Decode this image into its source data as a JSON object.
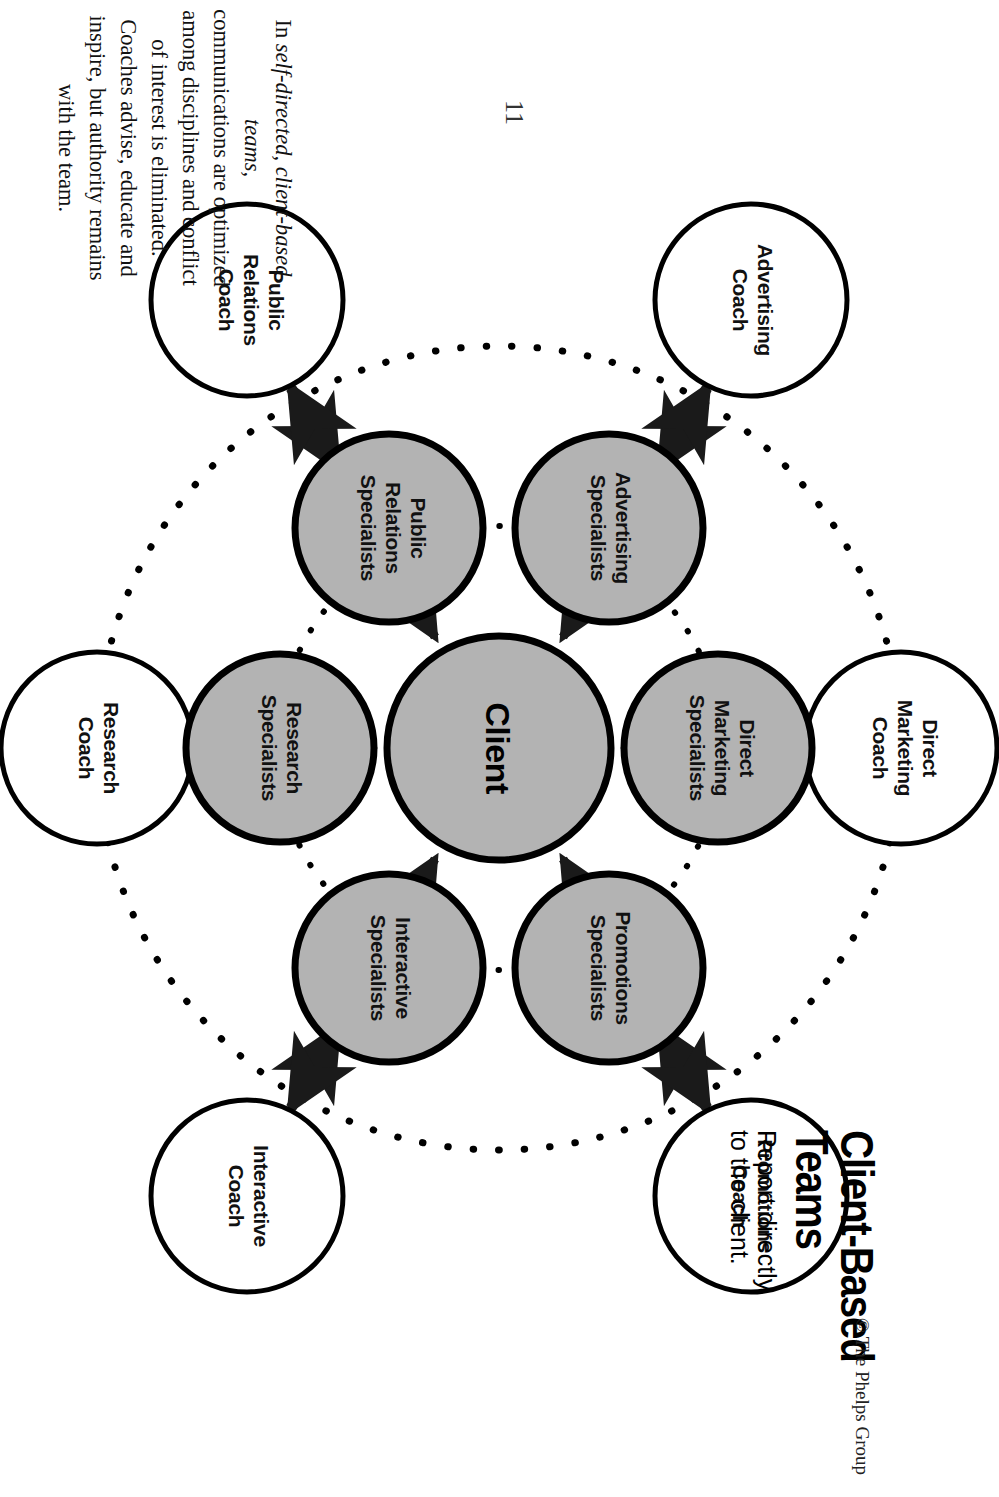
{
  "page": {
    "folio": "11",
    "copyright": "© The Phelps Group"
  },
  "header": {
    "title": "Client-Based\nTeams",
    "subtitle": "Report directly\nto the client."
  },
  "diagram": {
    "type": "hub-and-spoke",
    "center": {
      "id": "client",
      "label": "Client",
      "fill": "#b3b3b3",
      "stroke": "#000000"
    },
    "inner_ring_label": "Specialists",
    "outer_ring_label": "Coaches",
    "colors": {
      "specialist_fill": "#b3b3b3",
      "coach_fill": "#ffffff",
      "stroke": "#000000",
      "dotted_ring": "#000000",
      "arrow": "#1a1a1a"
    },
    "specialists": [
      {
        "id": "direct-marketing-specialists",
        "label": "Direct\nMarketing\nSpecialists"
      },
      {
        "id": "promotions-specialists",
        "label": "Promotions\nSpecialists"
      },
      {
        "id": "interactive-specialists",
        "label": "Interactive\nSpecialists"
      },
      {
        "id": "research-specialists",
        "label": "Research\nSpecialists"
      },
      {
        "id": "public-relations-specialists",
        "label": "Public\nRelations\nSpecialists"
      },
      {
        "id": "advertising-specialists",
        "label": "Advertising\nSpecialists"
      }
    ],
    "coaches": [
      {
        "id": "direct-marketing-coach",
        "label": "Direct\nMarketing\nCoach"
      },
      {
        "id": "promotions-coach",
        "label": "Promotions\nCoach"
      },
      {
        "id": "interactive-coach",
        "label": "Interactive\nCoach"
      },
      {
        "id": "research-coach",
        "label": "Research\nCoach"
      },
      {
        "id": "public-relations-coach",
        "label": "Public\nRelations\nCoach"
      },
      {
        "id": "advertising-coach",
        "label": "Advertising\nCoach"
      }
    ],
    "labels": {
      "direct_marketing_specialists_l1": "Direct",
      "direct_marketing_specialists_l2": "Marketing",
      "direct_marketing_specialists_l3": "Specialists",
      "promotions_specialists_l1": "Promotions",
      "promotions_specialists_l2": "Specialists",
      "interactive_specialists_l1": "Interactive",
      "interactive_specialists_l2": "Specialists",
      "research_specialists_l1": "Research",
      "research_specialists_l2": "Specialists",
      "public_relations_specialists_l1": "Public",
      "public_relations_specialists_l2": "Relations",
      "public_relations_specialists_l3": "Specialists",
      "advertising_specialists_l1": "Advertising",
      "advertising_specialists_l2": "Specialists",
      "direct_marketing_coach_l1": "Direct",
      "direct_marketing_coach_l2": "Marketing",
      "direct_marketing_coach_l3": "Coach",
      "promotions_coach_l1": "Promotions",
      "promotions_coach_l2": "Coach",
      "interactive_coach_l1": "Interactive",
      "interactive_coach_l2": "Coach",
      "research_coach_l1": "Research",
      "research_coach_l2": "Coach",
      "public_relations_coach_l1": "Public",
      "public_relations_coach_l2": "Relations",
      "public_relations_coach_l3": "Coach",
      "advertising_coach_l1": "Advertising",
      "advertising_coach_l2": "Coach",
      "client": "Client"
    }
  },
  "caption": {
    "line1_prefix": "In ",
    "line1_italic": "self-directed, client-based teams,",
    "line2": "communications are optimized",
    "line3": "among disciplines and conflict",
    "line4": "of interest is eliminated.",
    "line5": "Coaches advise, educate and",
    "line6": "inspire, but authority remains",
    "line7": "with the team."
  }
}
